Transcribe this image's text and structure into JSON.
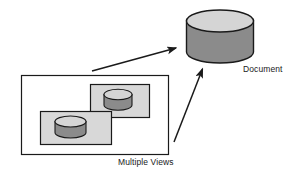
{
  "diagram": {
    "type": "architecture-flow",
    "background_color": "#ffffff",
    "labels": {
      "document": "Document",
      "multiple_views": "Multiple Views"
    },
    "colors": {
      "cylinder_top": "#d5d5d5",
      "cylinder_body": "#8b8b8b",
      "view_panel_fill": "#d8d8d8",
      "outline": "#1a1a1a",
      "arrow": "#1a1a1a",
      "container_fill": "#ffffff",
      "text": "#1a1a1a"
    },
    "nodes": [
      {
        "id": "document-cylinder",
        "shape": "cylinder",
        "label": "Document",
        "x": 186,
        "y": 9,
        "width": 67,
        "height": 54
      },
      {
        "id": "multiple-views-container",
        "shape": "rectangle",
        "label": "Multiple Views",
        "x": 21,
        "y": 75,
        "width": 148,
        "height": 80
      },
      {
        "id": "view-panel-back",
        "shape": "rectangle",
        "x": 90,
        "y": 84,
        "width": 60,
        "height": 34
      },
      {
        "id": "view-cylinder-back",
        "shape": "cylinder",
        "x": 104,
        "y": 90,
        "width": 28,
        "height": 21
      },
      {
        "id": "view-panel-front",
        "shape": "rectangle",
        "x": 40,
        "y": 111,
        "width": 72,
        "height": 34
      },
      {
        "id": "view-cylinder-front",
        "shape": "cylinder",
        "x": 55,
        "y": 116,
        "width": 31,
        "height": 22
      }
    ],
    "arrows": [
      {
        "id": "arrow-views-to-document-upper",
        "from": "multiple-views-container",
        "to": "document-cylinder",
        "x1": 92,
        "y1": 71,
        "x2": 178,
        "y2": 47
      },
      {
        "id": "arrow-views-to-document-lower",
        "from": "multiple-views-container",
        "to": "document-cylinder",
        "x1": 174,
        "y1": 142,
        "x2": 204,
        "y2": 66
      }
    ]
  }
}
